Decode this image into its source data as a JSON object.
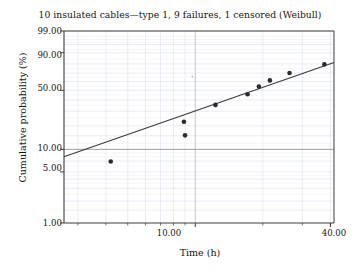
{
  "chart_data": {
    "type": "scatter",
    "title": "10 insulated cables—type 1, 9 failures, 1 censored (Weibull)",
    "xlabel": "Time (h)",
    "ylabel": "Cumulative probability (%)",
    "xscale": "log",
    "yscale": "weibull-probability",
    "xlim": [
      2.6,
      41.5
    ],
    "ylim": [
      1.0,
      99.0
    ],
    "grid": true,
    "legend": "none",
    "xtick_labels": [
      "10.00",
      "40.00"
    ],
    "xtick_values": [
      10.0,
      40.0
    ],
    "ytick_labels": [
      "1.00",
      "5.00",
      "10.00",
      "50.00",
      "90.00",
      "99.00"
    ],
    "ytick_values": [
      1.0,
      5.0,
      10.0,
      50.0,
      90.0,
      99.0
    ],
    "series": [
      {
        "name": "Failures",
        "marker": "filled-circle",
        "color": "#2b2b2b",
        "points": [
          {
            "x": 4.2,
            "y": 6.9
          },
          {
            "x": 8.9,
            "y": 22.5
          },
          {
            "x": 9.0,
            "y": 15.2
          },
          {
            "x": 12.3,
            "y": 35.3
          },
          {
            "x": 17.1,
            "y": 45.8
          },
          {
            "x": 19.2,
            "y": 54.2
          },
          {
            "x": 21.5,
            "y": 61.4
          },
          {
            "x": 26.3,
            "y": 70.1
          },
          {
            "x": 37.6,
            "y": 79.6
          }
        ]
      },
      {
        "name": "Censored",
        "marker": "small-dot",
        "color": "#b4b4b4",
        "points": [
          {
            "x": 9.7,
            "y": 66.0
          }
        ]
      }
    ],
    "fit_line": {
      "name": "Weibull fit line",
      "color": "#3a3a3a",
      "endpoints": [
        {
          "x": 2.6,
          "y": 8.0
        },
        {
          "x": 41.5,
          "y": 81.5
        }
      ]
    },
    "highlight_gridline": {
      "axis": "y",
      "value": 10.0,
      "color": "#9a9a9a"
    },
    "grid_color": "#dfe4ef",
    "axis_color": "#3c3c3c"
  }
}
